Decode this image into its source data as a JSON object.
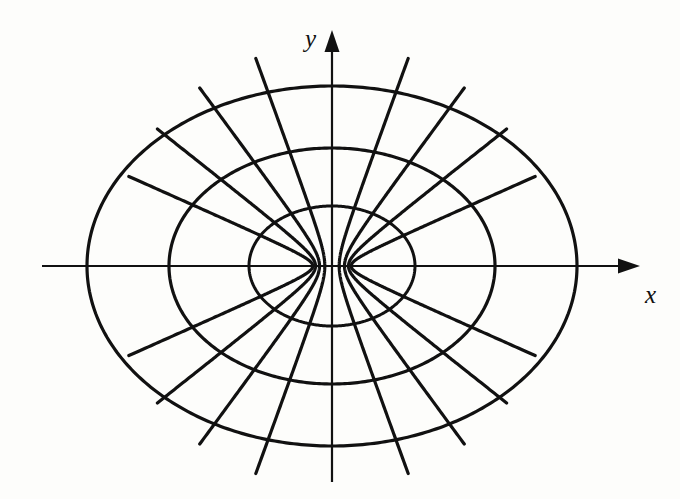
{
  "figure": {
    "background_color": "#fdfdfb",
    "stroke_color": "#111111",
    "width": 680,
    "height": 499
  },
  "axes": {
    "x_label": "x",
    "y_label": "y",
    "x_axis": {
      "name": "x-axis",
      "x_start": 42,
      "x_end": 640,
      "y": 266,
      "arrow": "right",
      "stroke_width": 2.2
    },
    "y_axis": {
      "name": "y-axis",
      "y_start": 30,
      "y_end": 482,
      "x": 332,
      "arrow": "up",
      "stroke_width": 2.2
    },
    "origin": {
      "x": 332,
      "y": 266
    },
    "label_positions": {
      "x": {
        "left": 645,
        "top": 282
      },
      "y": {
        "left": 305,
        "top": 26
      }
    }
  },
  "chart_data": {
    "type": "line",
    "xlabel": "x",
    "ylabel": "y",
    "grid": false,
    "legend": "none",
    "center_px": {
      "x": 332,
      "y": 266
    },
    "focal_distance_px": 21,
    "foci_px": [
      {
        "x": 311,
        "y": 266
      },
      {
        "x": 353,
        "y": 266
      }
    ],
    "ellipses": [
      {
        "name": "ellipse-inner",
        "a": 83,
        "b": 60,
        "stroke_width": 3.0
      },
      {
        "name": "ellipse-middle",
        "a": 163,
        "b": 118,
        "stroke_width": 3.2
      },
      {
        "name": "ellipse-outer",
        "a": 245,
        "b": 180,
        "stroke_width": 3.2
      }
    ],
    "hyperbolas": [
      {
        "name": "hyperbola-1",
        "a": 19.2,
        "b": 8.5,
        "stroke_width": 3.2
      },
      {
        "name": "hyperbola-2",
        "a": 16.5,
        "b": 13.0,
        "stroke_width": 3.2
      },
      {
        "name": "hyperbola-3",
        "a": 12.5,
        "b": 16.9,
        "stroke_width": 3.2
      },
      {
        "name": "hyperbola-4",
        "a": 7.2,
        "b": 19.7,
        "stroke_width": 3.2
      }
    ],
    "hyperbola_extent_t": 3.05,
    "counts": {
      "ellipses": 3,
      "hyperbola_pairs": 4,
      "hyperbola_branches": 8
    }
  }
}
